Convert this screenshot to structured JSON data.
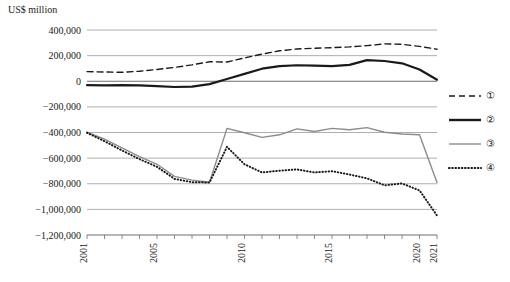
{
  "chart_data": {
    "type": "line",
    "title": "",
    "ylabel": "US$ million",
    "xlabel": "",
    "grid": true,
    "legend_position": "right",
    "x": [
      2001,
      2002,
      2003,
      2004,
      2005,
      2006,
      2007,
      2008,
      2009,
      2010,
      2011,
      2012,
      2013,
      2014,
      2015,
      2016,
      2017,
      2018,
      2019,
      2020,
      2021
    ],
    "xlim": [
      2001,
      2021
    ],
    "xticks": [
      2001,
      2005,
      2010,
      2015,
      2020,
      2021
    ],
    "xtick_labels": [
      "2001",
      "2005",
      "2010",
      "2015",
      "2020",
      "2021"
    ],
    "ylim": [
      -1200000,
      400000
    ],
    "yticks": [
      400000,
      200000,
      0,
      -200000,
      -400000,
      -600000,
      -800000,
      -1000000,
      -1200000
    ],
    "ytick_labels": [
      "400,000",
      "200,000",
      "0",
      "−200,000",
      "−400,000",
      "−600,000",
      "−800,000",
      "−1,000,000",
      "−1,200,000"
    ],
    "series": [
      {
        "name": "①",
        "style": "dashed",
        "color": "#1a1a1a",
        "width": 1.4,
        "values": [
          75000,
          72000,
          70000,
          78000,
          92000,
          108000,
          128000,
          152000,
          150000,
          182000,
          212000,
          238000,
          252000,
          258000,
          262000,
          268000,
          278000,
          292000,
          288000,
          272000,
          250000
        ]
      },
      {
        "name": "②",
        "style": "solid",
        "color": "#1a1a1a",
        "width": 2.2,
        "values": [
          -30000,
          -32000,
          -30000,
          -32000,
          -38000,
          -45000,
          -42000,
          -22000,
          18000,
          58000,
          98000,
          118000,
          125000,
          122000,
          118000,
          128000,
          165000,
          158000,
          140000,
          92000,
          12000
        ]
      },
      {
        "name": "③",
        "style": "solid",
        "color": "#8c8c8c",
        "width": 1.4,
        "values": [
          -398000,
          -452000,
          -520000,
          -588000,
          -648000,
          -742000,
          -772000,
          -788000,
          -368000,
          -402000,
          -438000,
          -418000,
          -372000,
          -392000,
          -368000,
          -378000,
          -362000,
          -398000,
          -412000,
          -418000,
          -790000
        ]
      },
      {
        "name": "④",
        "style": "dotted",
        "color": "#1a1a1a",
        "width": 2.0,
        "values": [
          -402000,
          -468000,
          -540000,
          -608000,
          -668000,
          -762000,
          -788000,
          -790000,
          -512000,
          -648000,
          -712000,
          -698000,
          -688000,
          -712000,
          -702000,
          -728000,
          -758000,
          -812000,
          -798000,
          -852000,
          -1048000
        ]
      }
    ]
  },
  "legend": {
    "items": [
      {
        "label": "①",
        "style": "dashed",
        "color": "#1a1a1a"
      },
      {
        "label": "②",
        "style": "solid-thick",
        "color": "#1a1a1a"
      },
      {
        "label": "③",
        "style": "solid-thin",
        "color": "#8c8c8c"
      },
      {
        "label": "④",
        "style": "dotted",
        "color": "#1a1a1a"
      }
    ]
  }
}
